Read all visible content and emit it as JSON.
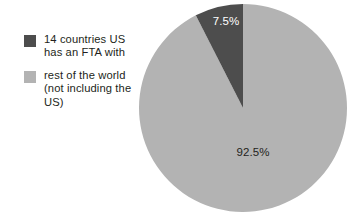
{
  "chart_data": {
    "type": "pie",
    "title": "",
    "categories": [
      "14 countries US has an FTA with",
      "rest of the world (not including the US)"
    ],
    "values": [
      7.5,
      92.5
    ],
    "data_labels": [
      "7.5%",
      "92.5%"
    ],
    "colors": [
      "#4d4d4d",
      "#b3b3b3"
    ],
    "label_colors": [
      "#ffffff",
      "#231f20"
    ],
    "legend_position": "left",
    "start_angle_deg": 0,
    "direction": "counterclockwise",
    "units": "percent",
    "background": "#ffffff"
  },
  "legend": {
    "items": [
      {
        "label_line1": "14 countries US",
        "label_line2": "has an FTA with",
        "label_line3": "",
        "swatch_color": "#4d4d4d"
      },
      {
        "label_line1": "rest of the world",
        "label_line2": "(not including the",
        "label_line3": "US)",
        "swatch_color": "#b3b3b3"
      }
    ]
  },
  "pie": {
    "slice_dark_label": "7.5%",
    "slice_light_label": "92.5%"
  }
}
